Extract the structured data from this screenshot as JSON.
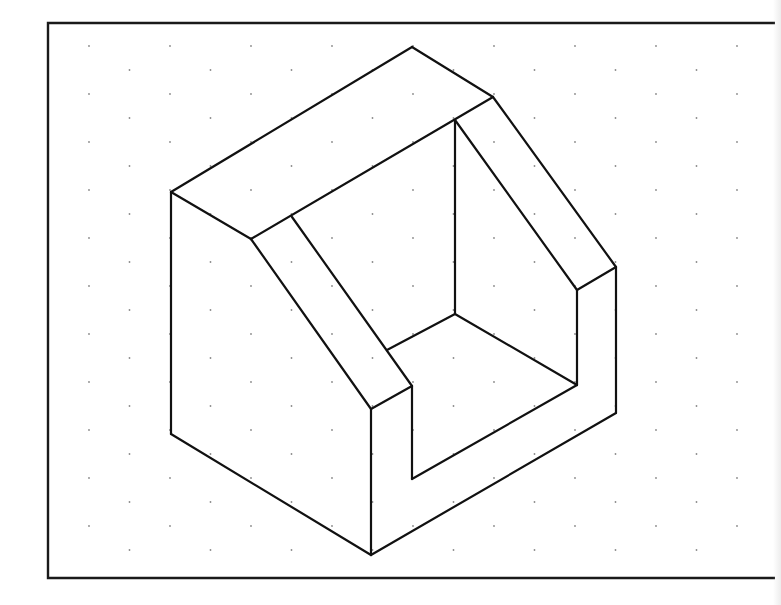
{
  "figure": {
    "type": "isometric-drawing",
    "colors": {
      "background": "#ffffff",
      "line": "#111111",
      "grid_dot": "#8a8a8a"
    }
  },
  "frame": {
    "left": 48,
    "top": 23,
    "right": 775,
    "bottom": 578
  },
  "grid": {
    "spacing_x": 40.5,
    "spacing_y": 24,
    "offset_x": 89,
    "offset_y": 46
  },
  "object": {
    "edges": [
      {
        "name": "top-ridge-left",
        "points": [
          [
            171,
            192
          ],
          [
            412,
            47
          ]
        ]
      },
      {
        "name": "top-ridge-right",
        "points": [
          [
            412,
            47
          ],
          [
            493,
            97
          ]
        ]
      },
      {
        "name": "top-front-edge",
        "points": [
          [
            171,
            192
          ],
          [
            251,
            239
          ]
        ]
      },
      {
        "name": "top-inner-edge",
        "points": [
          [
            251,
            239
          ],
          [
            493,
            97
          ]
        ]
      },
      {
        "name": "left-vertical",
        "points": [
          [
            171,
            192
          ],
          [
            171,
            434
          ]
        ]
      },
      {
        "name": "bottom-left",
        "points": [
          [
            171,
            434
          ],
          [
            371,
            555
          ]
        ]
      },
      {
        "name": "bottom-right",
        "points": [
          [
            371,
            555
          ],
          [
            616,
            413
          ]
        ]
      },
      {
        "name": "front-vertical",
        "points": [
          [
            371,
            409
          ],
          [
            371,
            555
          ]
        ]
      },
      {
        "name": "right-vertical",
        "points": [
          [
            616,
            267
          ],
          [
            616,
            413
          ]
        ]
      },
      {
        "name": "left-slope-outer",
        "points": [
          [
            251,
            239
          ],
          [
            371,
            409
          ]
        ]
      },
      {
        "name": "left-slope-inner",
        "points": [
          [
            292,
            217
          ],
          [
            412,
            386
          ]
        ]
      },
      {
        "name": "left-step-top",
        "points": [
          [
            371,
            409
          ],
          [
            412,
            386
          ]
        ]
      },
      {
        "name": "notch-left-vertical",
        "points": [
          [
            412,
            386
          ],
          [
            412,
            479
          ]
        ]
      },
      {
        "name": "notch-floor-front",
        "points": [
          [
            412,
            479
          ],
          [
            577,
            385
          ]
        ]
      },
      {
        "name": "notch-floor-left",
        "points": [
          [
            387,
            350
          ],
          [
            455,
            314
          ]
        ]
      },
      {
        "name": "notch-floor-back",
        "points": [
          [
            455,
            314
          ],
          [
            577,
            385
          ]
        ]
      },
      {
        "name": "back-vertical",
        "points": [
          [
            455,
            120
          ],
          [
            455,
            314
          ]
        ]
      },
      {
        "name": "right-slope-outer",
        "points": [
          [
            493,
            97
          ],
          [
            616,
            267
          ]
        ]
      },
      {
        "name": "right-slope-inner",
        "points": [
          [
            455,
            120
          ],
          [
            577,
            290
          ]
        ]
      },
      {
        "name": "right-step-top",
        "points": [
          [
            577,
            290
          ],
          [
            616,
            267
          ]
        ]
      },
      {
        "name": "notch-right-vertical",
        "points": [
          [
            577,
            290
          ],
          [
            577,
            385
          ]
        ]
      }
    ]
  }
}
